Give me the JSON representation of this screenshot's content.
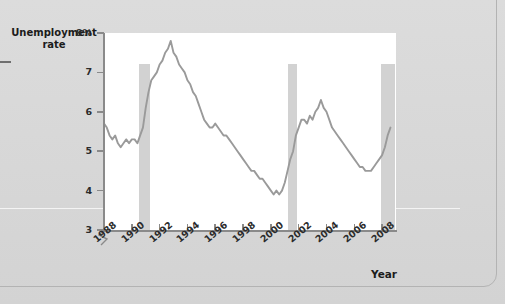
{
  "figure": {
    "background_color": "#d8d8d8",
    "plot_background_color": "#ffffff",
    "line_color": "#9a9a9a",
    "recession_band_color": "#d2d2d2",
    "axis_color": "#8a8a8a"
  },
  "axis_titles": {
    "y_line1": "Unemployment",
    "y_line2": "rate",
    "x": "Year"
  },
  "chart_data": {
    "type": "line",
    "title": "",
    "subtitle": "",
    "xlabel": "Year",
    "ylabel": "Unemployment rate",
    "xlim": [
      1988,
      2009
    ],
    "ylim": [
      3,
      8
    ],
    "grid": false,
    "legend": null,
    "y_tick_labels": [
      "8%",
      "7",
      "6",
      "5",
      "4",
      "3"
    ],
    "y_ticks": [
      8,
      7,
      6,
      5,
      4,
      3
    ],
    "y_axis_break": true,
    "x_tick_labels": [
      "1988",
      "1990",
      "1992",
      "1994",
      "1996",
      "1998",
      "2000",
      "2002",
      "2004",
      "2006",
      "2008"
    ],
    "x_ticks": [
      1988,
      1990,
      1992,
      1994,
      1996,
      1998,
      2000,
      2002,
      2004,
      2006,
      2008
    ],
    "annotations": [
      {
        "type": "shaded-band",
        "name": "recession-1990-1991",
        "x_start": 1990.5,
        "x_end": 1991.3
      },
      {
        "type": "shaded-band",
        "name": "recession-2001",
        "x_start": 2001.2,
        "x_end": 2001.9
      },
      {
        "type": "shaded-band",
        "name": "recession-2008",
        "x_start": 2007.9,
        "x_end": 2008.9
      }
    ],
    "series": [
      {
        "name": "Unemployment rate",
        "units": "percent",
        "x": [
          1988.0,
          1988.2,
          1988.4,
          1988.6,
          1988.8,
          1989.0,
          1989.2,
          1989.4,
          1989.6,
          1989.8,
          1990.0,
          1990.2,
          1990.4,
          1990.6,
          1990.8,
          1991.0,
          1991.2,
          1991.4,
          1991.6,
          1991.8,
          1992.0,
          1992.2,
          1992.4,
          1992.6,
          1992.8,
          1993.0,
          1993.2,
          1993.4,
          1993.6,
          1993.8,
          1994.0,
          1994.2,
          1994.4,
          1994.6,
          1994.8,
          1995.0,
          1995.2,
          1995.4,
          1995.6,
          1995.8,
          1996.0,
          1996.2,
          1996.4,
          1996.6,
          1996.8,
          1997.0,
          1997.2,
          1997.4,
          1997.6,
          1997.8,
          1998.0,
          1998.2,
          1998.4,
          1998.6,
          1998.8,
          1999.0,
          1999.2,
          1999.4,
          1999.6,
          1999.8,
          2000.0,
          2000.2,
          2000.4,
          2000.6,
          2000.8,
          2001.0,
          2001.2,
          2001.4,
          2001.6,
          2001.8,
          2002.0,
          2002.2,
          2002.4,
          2002.6,
          2002.8,
          2003.0,
          2003.2,
          2003.4,
          2003.6,
          2003.8,
          2004.0,
          2004.2,
          2004.4,
          2004.6,
          2004.8,
          2005.0,
          2005.2,
          2005.4,
          2005.6,
          2005.8,
          2006.0,
          2006.2,
          2006.4,
          2006.6,
          2006.8,
          2007.0,
          2007.2,
          2007.4,
          2007.6,
          2007.8,
          2008.0,
          2008.2,
          2008.4,
          2008.6
        ],
        "values": [
          5.7,
          5.6,
          5.4,
          5.3,
          5.4,
          5.2,
          5.1,
          5.2,
          5.3,
          5.2,
          5.3,
          5.3,
          5.2,
          5.4,
          5.6,
          6.1,
          6.5,
          6.8,
          6.9,
          7.0,
          7.2,
          7.3,
          7.5,
          7.6,
          7.8,
          7.5,
          7.4,
          7.2,
          7.1,
          7.0,
          6.8,
          6.7,
          6.5,
          6.4,
          6.2,
          6.0,
          5.8,
          5.7,
          5.6,
          5.6,
          5.7,
          5.6,
          5.5,
          5.4,
          5.4,
          5.3,
          5.2,
          5.1,
          5.0,
          4.9,
          4.8,
          4.7,
          4.6,
          4.5,
          4.5,
          4.4,
          4.3,
          4.3,
          4.2,
          4.1,
          4.0,
          3.9,
          4.0,
          3.9,
          4.0,
          4.2,
          4.5,
          4.8,
          5.0,
          5.4,
          5.6,
          5.8,
          5.8,
          5.7,
          5.9,
          5.8,
          6.0,
          6.1,
          6.3,
          6.1,
          6.0,
          5.8,
          5.6,
          5.5,
          5.4,
          5.3,
          5.2,
          5.1,
          5.0,
          4.9,
          4.8,
          4.7,
          4.6,
          4.6,
          4.5,
          4.5,
          4.5,
          4.6,
          4.7,
          4.8,
          4.9,
          5.1,
          5.4,
          5.6
        ]
      }
    ]
  }
}
